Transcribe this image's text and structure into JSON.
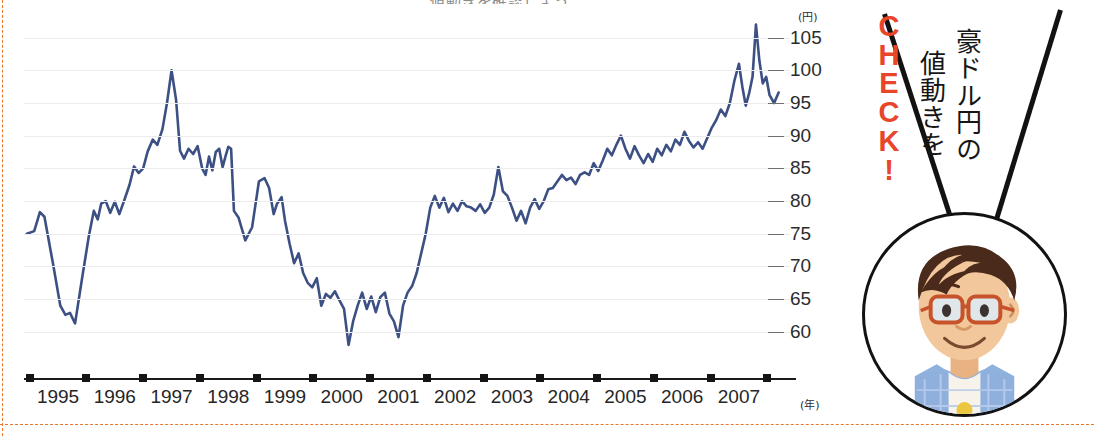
{
  "top_strip_text": "値動きを確認しよう。",
  "colors": {
    "line": "#3c5084",
    "grid": "#ececec",
    "accent_orange": "#e8452a",
    "dash_border": "#e8762c",
    "axis": "#1a1a1a"
  },
  "chart_data": {
    "type": "line",
    "title": "",
    "xlabel": "",
    "ylabel": "",
    "x_unit": "(年)",
    "y_unit": "(円)",
    "grid": true,
    "legend": "none",
    "xlim": [
      1994.4,
      2007.9
    ],
    "ylim": [
      56,
      108
    ],
    "yticks": [
      105,
      100,
      95,
      90,
      85,
      80,
      75,
      70,
      65,
      60
    ],
    "xticks": [
      1995,
      1996,
      1997,
      1998,
      1999,
      2000,
      2001,
      2002,
      2003,
      2004,
      2005,
      2006,
      2007
    ],
    "series": [
      {
        "name": "豪ドル/円",
        "color": "#3c5084",
        "points": [
          [
            1994.45,
            75.0
          ],
          [
            1994.58,
            75.4
          ],
          [
            1994.68,
            78.3
          ],
          [
            1994.76,
            77.6
          ],
          [
            1994.92,
            70.0
          ],
          [
            1995.04,
            64.0
          ],
          [
            1995.13,
            62.6
          ],
          [
            1995.21,
            62.9
          ],
          [
            1995.3,
            61.3
          ],
          [
            1995.42,
            68.0
          ],
          [
            1995.54,
            74.5
          ],
          [
            1995.63,
            78.5
          ],
          [
            1995.7,
            77.2
          ],
          [
            1995.76,
            79.6
          ],
          [
            1995.84,
            80.0
          ],
          [
            1995.92,
            78.2
          ],
          [
            1996.0,
            79.9
          ],
          [
            1996.08,
            78.0
          ],
          [
            1996.17,
            80.2
          ],
          [
            1996.26,
            82.5
          ],
          [
            1996.34,
            85.3
          ],
          [
            1996.42,
            84.3
          ],
          [
            1996.5,
            85.0
          ],
          [
            1996.58,
            87.6
          ],
          [
            1996.67,
            89.4
          ],
          [
            1996.75,
            88.6
          ],
          [
            1996.84,
            91.0
          ],
          [
            1996.92,
            95.0
          ],
          [
            1997.0,
            100.0
          ],
          [
            1997.08,
            95.5
          ],
          [
            1997.15,
            87.7
          ],
          [
            1997.22,
            86.5
          ],
          [
            1997.3,
            88.0
          ],
          [
            1997.38,
            87.2
          ],
          [
            1997.46,
            88.4
          ],
          [
            1997.54,
            85.0
          ],
          [
            1997.6,
            84.0
          ],
          [
            1997.66,
            86.8
          ],
          [
            1997.72,
            84.7
          ],
          [
            1997.78,
            87.5
          ],
          [
            1997.84,
            88.0
          ],
          [
            1997.9,
            85.2
          ],
          [
            1997.95,
            86.8
          ],
          [
            1998.0,
            88.3
          ],
          [
            1998.05,
            88.0
          ],
          [
            1998.1,
            78.5
          ],
          [
            1998.18,
            77.5
          ],
          [
            1998.3,
            74.0
          ],
          [
            1998.42,
            76.0
          ],
          [
            1998.54,
            83.0
          ],
          [
            1998.64,
            83.5
          ],
          [
            1998.72,
            82.0
          ],
          [
            1998.8,
            78.0
          ],
          [
            1998.86,
            79.6
          ],
          [
            1998.94,
            80.6
          ],
          [
            1999.0,
            77.0
          ],
          [
            1999.08,
            73.5
          ],
          [
            1999.16,
            70.5
          ],
          [
            1999.24,
            72.0
          ],
          [
            1999.32,
            69.0
          ],
          [
            1999.4,
            67.5
          ],
          [
            1999.48,
            66.8
          ],
          [
            1999.56,
            68.2
          ],
          [
            1999.64,
            64.0
          ],
          [
            1999.72,
            65.8
          ],
          [
            1999.8,
            65.2
          ],
          [
            1999.88,
            66.2
          ],
          [
            1999.96,
            64.8
          ],
          [
            2000.04,
            63.5
          ],
          [
            2000.12,
            58.0
          ],
          [
            2000.2,
            61.6
          ],
          [
            2000.28,
            64.0
          ],
          [
            2000.36,
            66.0
          ],
          [
            2000.44,
            63.5
          ],
          [
            2000.52,
            65.4
          ],
          [
            2000.6,
            63.0
          ],
          [
            2000.68,
            65.3
          ],
          [
            2000.76,
            66.0
          ],
          [
            2000.84,
            62.8
          ],
          [
            2000.92,
            61.6
          ],
          [
            2001.0,
            59.2
          ],
          [
            2001.08,
            64.0
          ],
          [
            2001.16,
            66.0
          ],
          [
            2001.24,
            67.0
          ],
          [
            2001.32,
            69.0
          ],
          [
            2001.4,
            72.0
          ],
          [
            2001.48,
            75.0
          ],
          [
            2001.56,
            79.0
          ],
          [
            2001.64,
            80.8
          ],
          [
            2001.72,
            79.0
          ],
          [
            2001.8,
            80.5
          ],
          [
            2001.88,
            78.3
          ],
          [
            2001.96,
            79.6
          ],
          [
            2002.04,
            78.5
          ],
          [
            2002.12,
            80.0
          ],
          [
            2002.2,
            79.2
          ],
          [
            2002.28,
            79.0
          ],
          [
            2002.36,
            78.5
          ],
          [
            2002.44,
            79.5
          ],
          [
            2002.52,
            78.2
          ],
          [
            2002.6,
            79.0
          ],
          [
            2002.68,
            81.0
          ],
          [
            2002.76,
            85.2
          ],
          [
            2002.84,
            81.5
          ],
          [
            2002.92,
            80.8
          ],
          [
            2003.0,
            79.0
          ],
          [
            2003.08,
            77.0
          ],
          [
            2003.16,
            78.5
          ],
          [
            2003.24,
            76.6
          ],
          [
            2003.32,
            79.0
          ],
          [
            2003.4,
            80.3
          ],
          [
            2003.48,
            78.8
          ],
          [
            2003.56,
            80.0
          ],
          [
            2003.64,
            81.8
          ],
          [
            2003.72,
            82.0
          ],
          [
            2003.8,
            83.0
          ],
          [
            2003.88,
            84.0
          ],
          [
            2003.96,
            83.2
          ],
          [
            2004.04,
            83.6
          ],
          [
            2004.12,
            82.6
          ],
          [
            2004.2,
            84.0
          ],
          [
            2004.28,
            84.4
          ],
          [
            2004.36,
            84.0
          ],
          [
            2004.44,
            85.8
          ],
          [
            2004.52,
            84.6
          ],
          [
            2004.6,
            86.2
          ],
          [
            2004.68,
            88.0
          ],
          [
            2004.76,
            87.0
          ],
          [
            2004.84,
            88.6
          ],
          [
            2004.92,
            90.0
          ],
          [
            2005.0,
            88.0
          ],
          [
            2005.08,
            86.5
          ],
          [
            2005.16,
            88.4
          ],
          [
            2005.24,
            87.0
          ],
          [
            2005.32,
            85.8
          ],
          [
            2005.4,
            87.2
          ],
          [
            2005.48,
            86.0
          ],
          [
            2005.56,
            88.0
          ],
          [
            2005.64,
            87.0
          ],
          [
            2005.72,
            88.6
          ],
          [
            2005.8,
            87.6
          ],
          [
            2005.88,
            89.4
          ],
          [
            2005.96,
            88.6
          ],
          [
            2006.04,
            90.6
          ],
          [
            2006.12,
            89.2
          ],
          [
            2006.2,
            88.2
          ],
          [
            2006.28,
            89.0
          ],
          [
            2006.36,
            88.0
          ],
          [
            2006.44,
            89.6
          ],
          [
            2006.52,
            91.2
          ],
          [
            2006.6,
            92.4
          ],
          [
            2006.68,
            94.0
          ],
          [
            2006.76,
            93.0
          ],
          [
            2006.84,
            95.0
          ],
          [
            2006.92,
            98.4
          ],
          [
            2007.0,
            101.0
          ],
          [
            2007.06,
            97.5
          ],
          [
            2007.12,
            94.6
          ],
          [
            2007.18,
            96.5
          ],
          [
            2007.24,
            99.0
          ],
          [
            2007.3,
            107.0
          ],
          [
            2007.36,
            101.5
          ],
          [
            2007.42,
            98.0
          ],
          [
            2007.48,
            99.0
          ],
          [
            2007.54,
            96.2
          ],
          [
            2007.62,
            95.0
          ],
          [
            2007.7,
            96.6
          ]
        ]
      }
    ]
  },
  "callout": {
    "check_label": "CHECK!",
    "check_letters": [
      "C",
      "H",
      "E",
      "C",
      "K",
      "!"
    ],
    "line1": "豪ドル円の",
    "line2": "値動きを"
  },
  "avatar": {
    "alt": "眼鏡の男性キャラクター",
    "hair_color": "#4a2a1b",
    "skin_color": "#f2c79c",
    "glasses_color": "#c7532b",
    "shirt_color": "#8fb1dd"
  }
}
